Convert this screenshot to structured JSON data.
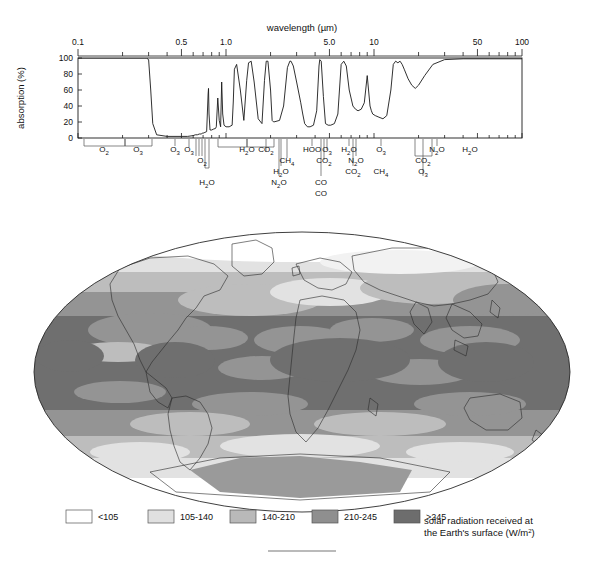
{
  "figure": {
    "bottom_rule": true
  },
  "absorption_chart": {
    "axis_title_top": "wavelength (µm)",
    "ylabel": "absorption (%)",
    "x_tick_labels": [
      "0.1",
      "0.5",
      "1.0",
      "5.0",
      "10",
      "50",
      "100"
    ],
    "y_tick_labels": [
      "0",
      "20",
      "40",
      "60",
      "80",
      "100"
    ],
    "gas_labels_row1": [
      {
        "text": "O",
        "sub": "2"
      },
      {
        "text": "O",
        "sub": "3"
      },
      {
        "text": "O",
        "sub": "3"
      },
      {
        "text": "H",
        "sub": "2",
        "tail": "O"
      },
      {
        "text": "CO",
        "sub": "2"
      },
      {
        "text": "HOO",
        "sub": ""
      },
      {
        "text": "O",
        "sub": "3"
      },
      {
        "text": "H",
        "sub": "2",
        "tail": "O"
      },
      {
        "text": "O",
        "sub": "3"
      },
      {
        "text": "N",
        "sub": "2",
        "tail": "O"
      },
      {
        "text": "H",
        "sub": "2",
        "tail": "O"
      }
    ],
    "gas_labels_row2": [
      {
        "text": "O",
        "sub": "2"
      },
      {
        "text": "CH",
        "sub": "4"
      },
      {
        "text": "CO",
        "sub": "2"
      },
      {
        "text": "N",
        "sub": "2",
        "tail": "O"
      },
      {
        "text": "CO",
        "sub": "2"
      }
    ],
    "gas_labels_row3": [
      {
        "text": "H",
        "sub": "2",
        "tail": "O"
      },
      {
        "text": "CO",
        "sub": "2"
      },
      {
        "text": "CH",
        "sub": "4"
      },
      {
        "text": "O",
        "sub": "3"
      }
    ],
    "gas_labels_row4": [
      {
        "text": "H",
        "sub": "2",
        "tail": "O"
      },
      {
        "text": "N",
        "sub": "2",
        "tail": "O"
      },
      {
        "text": "CO",
        "sub": ""
      }
    ]
  },
  "chart_data": {
    "type": "line",
    "xlabel": "wavelength (µm)",
    "ylabel": "absorption (%)",
    "xscale": "log",
    "xlim": [
      0.1,
      100
    ],
    "ylim": [
      0,
      100
    ],
    "grid": false,
    "legend": "none",
    "x_ticks": [
      0.1,
      0.5,
      1.0,
      5.0,
      10,
      50,
      100
    ],
    "y_ticks": [
      0,
      20,
      40,
      60,
      80,
      100
    ],
    "series": [
      {
        "name": "total atmospheric absorption",
        "x": [
          0.1,
          0.22,
          0.28,
          0.29,
          0.3,
          0.31,
          0.32,
          0.34,
          0.4,
          0.5,
          0.55,
          0.6,
          0.62,
          0.64,
          0.66,
          0.68,
          0.69,
          0.7,
          0.72,
          0.74,
          0.757,
          0.762,
          0.768,
          0.78,
          0.8,
          0.82,
          0.85,
          0.86,
          0.88,
          0.9,
          0.92,
          0.935,
          0.95,
          0.97,
          1.0,
          1.05,
          1.1,
          1.12,
          1.14,
          1.18,
          1.25,
          1.32,
          1.38,
          1.42,
          1.48,
          1.55,
          1.65,
          1.75,
          1.82,
          1.87,
          1.92,
          2.0,
          2.05,
          2.1,
          2.3,
          2.45,
          2.6,
          2.7,
          2.75,
          2.85,
          3.0,
          3.2,
          3.3,
          3.4,
          3.55,
          3.7,
          3.9,
          4.1,
          4.25,
          4.3,
          4.4,
          4.55,
          4.7,
          4.9,
          5.1,
          5.4,
          5.7,
          6.0,
          6.25,
          6.5,
          6.8,
          7.2,
          7.5,
          7.8,
          8.2,
          8.6,
          9.0,
          9.4,
          9.6,
          9.8,
          10.2,
          10.8,
          11.5,
          12.2,
          13.0,
          13.5,
          14.0,
          14.5,
          15.0,
          15.5,
          16.0,
          17.0,
          18.0,
          19.0,
          20.0,
          22.0,
          25.0,
          30.0,
          40.0,
          60.0,
          100.0
        ],
        "y": [
          100,
          100,
          100,
          100,
          98,
          60,
          18,
          4,
          2,
          2,
          2,
          3,
          4,
          4,
          5,
          5,
          6,
          6,
          7,
          8,
          55,
          62,
          30,
          10,
          10,
          11,
          12,
          14,
          50,
          22,
          14,
          70,
          30,
          16,
          14,
          14,
          16,
          45,
          86,
          92,
          60,
          22,
          72,
          94,
          96,
          70,
          24,
          18,
          72,
          96,
          96,
          60,
          22,
          20,
          22,
          40,
          88,
          96,
          96,
          90,
          70,
          44,
          30,
          18,
          14,
          14,
          16,
          34,
          90,
          98,
          96,
          52,
          18,
          16,
          16,
          18,
          30,
          92,
          96,
          90,
          60,
          40,
          36,
          34,
          36,
          44,
          78,
          40,
          34,
          30,
          28,
          26,
          24,
          28,
          60,
          92,
          96,
          94,
          96,
          92,
          86,
          74,
          66,
          62,
          66,
          78,
          92,
          98,
          99,
          99,
          99
        ]
      }
    ]
  },
  "map": {
    "projection": "mollweide",
    "title": "solar radiation received at the Earth's surface",
    "units": "W/m2"
  },
  "legend": {
    "caption_line1": "solar radiation received at",
    "caption_line2_pre": "the Earth's surface (W/m",
    "caption_line2_sup": "2",
    "caption_line2_post": ")",
    "items": [
      {
        "label": "<105",
        "color": "#ffffff"
      },
      {
        "label": "105-140",
        "color": "#e0e0e0"
      },
      {
        "label": "140-210",
        "color": "#b9b9b9"
      },
      {
        "label": "210-245",
        "color": "#8f8f8f"
      },
      {
        "label": ">245",
        "color": "#6d6d6d"
      }
    ]
  }
}
